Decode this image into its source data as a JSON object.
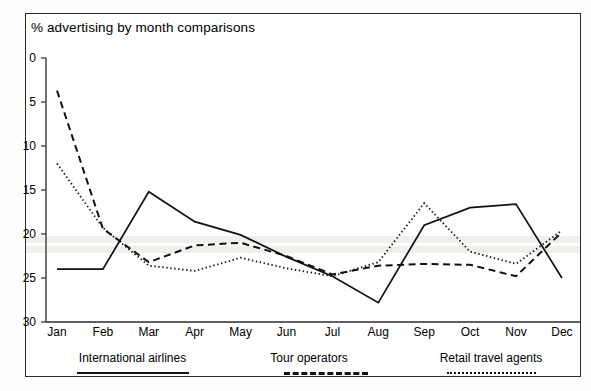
{
  "chart_data": {
    "type": "line",
    "title": "% advertising by month comparisons",
    "xlabel": "",
    "ylabel": "",
    "ylim": [
      0,
      30
    ],
    "yticks": [
      0,
      5,
      10,
      15,
      20,
      25,
      30
    ],
    "grid": false,
    "legend_position": "bottom",
    "categories": [
      "Jan",
      "Feb",
      "Mar",
      "Apr",
      "May",
      "Jun",
      "Jul",
      "Aug",
      "Sep",
      "Oct",
      "Nov",
      "Dec"
    ],
    "series": [
      {
        "name": "International airlines",
        "style": "solid",
        "color": "#111111",
        "values": [
          6.0,
          6.0,
          14.8,
          11.4,
          9.9,
          7.4,
          5.2,
          2.2,
          11.0,
          13.0,
          13.4,
          5.0
        ]
      },
      {
        "name": "Tour operators",
        "style": "dashed",
        "color": "#111111",
        "values": [
          26.3,
          10.6,
          6.8,
          8.7,
          9.0,
          7.5,
          5.4,
          6.4,
          6.6,
          6.5,
          5.2,
          10.2
        ]
      },
      {
        "name": "Retail travel agents",
        "style": "dotted",
        "color": "#111111",
        "values": [
          18.0,
          10.7,
          6.4,
          5.8,
          7.3,
          6.1,
          5.2,
          6.8,
          13.5,
          8.0,
          6.6,
          10.4
        ]
      }
    ]
  },
  "axis": {
    "y_tick_labels": [
      "30",
      "25",
      "20",
      "15",
      "10",
      "5",
      "0"
    ],
    "x_tick_labels": [
      "Jan",
      "Feb",
      "Mar",
      "Apr",
      "May",
      "Jun",
      "Jul",
      "Aug",
      "Sep",
      "Oct",
      "Nov",
      "Dec"
    ]
  },
  "legend": {
    "items": [
      {
        "label": "International airlines",
        "style": "solid"
      },
      {
        "label": "Tour operators",
        "style": "dashed"
      },
      {
        "label": "Retail travel agents",
        "style": "dotted"
      }
    ]
  }
}
